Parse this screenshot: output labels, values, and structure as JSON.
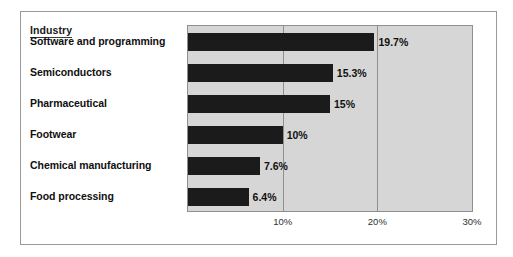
{
  "chart_data": {
    "type": "bar",
    "orientation": "horizontal",
    "title": "",
    "xlabel": "",
    "ylabel": "Industry",
    "legend_title": "Industry",
    "categories": [
      "Software and programming",
      "Semiconductors",
      "Pharmaceutical",
      "Footwear",
      "Chemical manufacturing",
      "Food processing"
    ],
    "values": [
      19.7,
      15.3,
      15,
      10,
      7.6,
      6.4
    ],
    "value_labels": [
      "19.7%",
      "15.3%",
      "15%",
      "10%",
      "7.6%",
      "6.4%"
    ],
    "xlim": [
      0,
      30
    ],
    "xticks": [
      10,
      20,
      30
    ],
    "xtick_labels": [
      "10%",
      "20%",
      "30%"
    ],
    "grid": true,
    "legend_position": "none",
    "bar_color": "#1b1b1b",
    "plot_background": "#d6d6d6",
    "axis_color": "#8f8f8f"
  }
}
